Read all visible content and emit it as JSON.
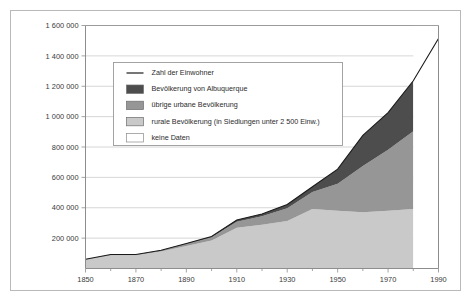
{
  "chart_data": {
    "type": "area",
    "title": "",
    "subtitle": "",
    "xlabel": "",
    "ylabel": "",
    "xlim": [
      1850,
      1990
    ],
    "ylim": [
      0,
      1600000
    ],
    "grid": true,
    "grid_axis": "y",
    "legend_position": "inside-upper-left",
    "stacked": true,
    "x": [
      1850,
      1860,
      1870,
      1880,
      1890,
      1900,
      1910,
      1920,
      1930,
      1940,
      1950,
      1960,
      1970,
      1980,
      1990
    ],
    "xtick_labels": [
      "1850",
      "1870",
      "1890",
      "1910",
      "1930",
      "1950",
      "1970",
      "1990"
    ],
    "xticks": [
      1850,
      1870,
      1890,
      1910,
      1930,
      1950,
      1970,
      1990
    ],
    "ytick_labels": [
      "200 000",
      "400 000",
      "600 000",
      "800 000",
      "1 000 000",
      "1 200 000",
      "1 400 000",
      "1 600 000"
    ],
    "yticks": [
      200000,
      400000,
      600000,
      800000,
      1000000,
      1200000,
      1400000,
      1600000
    ],
    "series": [
      {
        "name": "rurale Bevölkerung (in Siedlungen unter 2 500 Einw.)",
        "key": "rural",
        "color": "#c9c9c9",
        "values": [
          58000,
          88000,
          88000,
          112000,
          148000,
          185000,
          268000,
          288000,
          313000,
          392000,
          380000,
          370000,
          380000,
          392000,
          null
        ]
      },
      {
        "name": "übrige urbane Bevölkerung",
        "key": "other_urban",
        "color": "#969696",
        "values": [
          3000,
          4000,
          4000,
          6000,
          13000,
          20000,
          40000,
          56000,
          83000,
          111000,
          178000,
          305000,
          402000,
          512000,
          null
        ]
      },
      {
        "name": "Bevölkerung von Albuquerque",
        "key": "albuquerque",
        "color": "#4d4d4d",
        "values": [
          0,
          0,
          0,
          2000,
          4000,
          6000,
          11000,
          15000,
          26000,
          35000,
          96000,
          201000,
          244000,
          332000,
          null
        ]
      }
    ],
    "total_line": {
      "name": "Zahl der Einwohner",
      "color": "#1a1a1a",
      "values": [
        61000,
        92000,
        92000,
        120000,
        165000,
        211000,
        319000,
        359000,
        422000,
        538000,
        654000,
        876000,
        1026000,
        1236000,
        1515000
      ]
    },
    "no_data": {
      "name": "keine Daten",
      "color": "#ffffff",
      "from": 1980,
      "to": 1990
    },
    "annotations": []
  },
  "legend": {
    "items": [
      {
        "label": "Zahl der Einwohner",
        "swatch": "line",
        "color": "#1a1a1a"
      },
      {
        "label": "Bevölkerung von Albuquerque",
        "swatch": "box",
        "color": "#4d4d4d"
      },
      {
        "label": "übrige urbane Bevölkerung",
        "swatch": "box",
        "color": "#969696"
      },
      {
        "label": "rurale Bevölkerung (in Siedlungen unter 2 500 Einw.)",
        "swatch": "box",
        "color": "#c9c9c9"
      },
      {
        "label": "keine Daten",
        "swatch": "box",
        "color": "#ffffff"
      }
    ]
  },
  "colors": {
    "frame": "#b9b9b9",
    "axis": "#8d8d8d",
    "grid": "#cccccc",
    "text": "#3b3b3b",
    "background": "#ffffff"
  }
}
